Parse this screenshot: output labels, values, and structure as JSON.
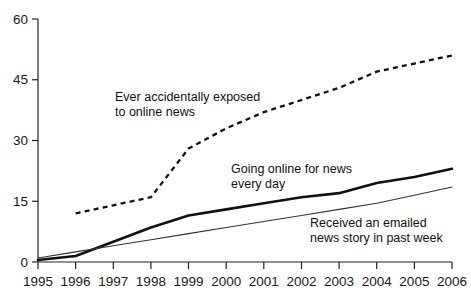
{
  "chart_data": {
    "type": "line",
    "title": "",
    "subtitle": "",
    "xlabel": "",
    "ylabel": "",
    "xlim": [
      1995,
      2006
    ],
    "ylim": [
      0,
      60
    ],
    "yticks": [
      0,
      15,
      30,
      45,
      60
    ],
    "xticks": [
      1995,
      1996,
      1997,
      1998,
      1999,
      2000,
      2001,
      2002,
      2003,
      2004,
      2005,
      2006
    ],
    "grid": false,
    "legend_position": "inline-annotations",
    "series": [
      {
        "name": "Ever accidentally exposed to online news",
        "style": "dashed",
        "color": "#111111",
        "x": [
          1996,
          1997,
          1998,
          1999,
          2000,
          2001,
          2002,
          2003,
          2004,
          2005,
          2006
        ],
        "values": [
          12,
          14,
          16,
          28,
          33,
          37,
          40,
          43,
          47,
          49,
          51
        ]
      },
      {
        "name": "Going online for news every day",
        "style": "solid-bold",
        "color": "#111111",
        "x": [
          1995,
          1996,
          1997,
          1998,
          1999,
          2000,
          2001,
          2002,
          2003,
          2004,
          2005,
          2006
        ],
        "values": [
          0.5,
          1.5,
          5,
          8.5,
          11.5,
          13,
          14.5,
          16,
          17,
          19.5,
          21,
          23
        ]
      },
      {
        "name": "Received an emailed news story in past week",
        "style": "solid-thin",
        "color": "#333333",
        "x": [
          1995,
          1996,
          1997,
          1998,
          1999,
          2000,
          2001,
          2002,
          2003,
          2004,
          2005,
          2006
        ],
        "values": [
          1,
          2.5,
          4,
          5.5,
          7,
          8.5,
          10,
          11.5,
          13,
          14.5,
          16.5,
          18.5
        ]
      }
    ],
    "annotations": [
      {
        "id": "a1",
        "line1": "Ever accidentally exposed",
        "line2": "to online news"
      },
      {
        "id": "a2",
        "line1": "Going online for news",
        "line2": "every day"
      },
      {
        "id": "a3",
        "line1": "Received an emailed",
        "line2": "news story in past week"
      }
    ]
  },
  "axis": {
    "y": {
      "t0": "0",
      "t1": "15",
      "t2": "30",
      "t3": "45",
      "t4": "60"
    },
    "x": {
      "t0": "1995",
      "t1": "1996",
      "t2": "1997",
      "t3": "1998",
      "t4": "1999",
      "t5": "2000",
      "t6": "2001",
      "t7": "2002",
      "t8": "2003",
      "t9": "2004",
      "t10": "2005",
      "t11": "2006"
    }
  }
}
